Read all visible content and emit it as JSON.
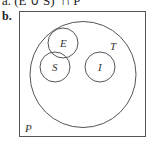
{
  "header": {
    "partial_previous_line": "a. (E ∪ S)′ ∩ P",
    "part_label": "b."
  },
  "diagram": {
    "type": "venn",
    "universe": {
      "label": "P"
    },
    "sets": [
      {
        "label": "T",
        "contains": [
          "E",
          "S",
          "I"
        ]
      },
      {
        "label": "E",
        "parent": "T"
      },
      {
        "label": "S",
        "parent": "T"
      },
      {
        "label": "I",
        "parent": "T"
      }
    ],
    "stroke_color": "#555555"
  }
}
